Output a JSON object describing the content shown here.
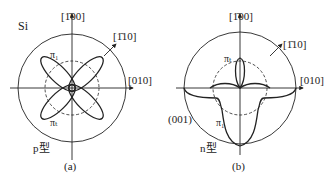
{
  "material": "Si",
  "panels": [
    {
      "id": "a",
      "caption": "(a)",
      "type_label": "p型",
      "axis_top": "[1̄00]",
      "axis_right": "[010]",
      "axis_diag": "[1̄10]",
      "pi_top": "π₁",
      "pi_bottom": "πₜ"
    },
    {
      "id": "b",
      "caption": "(b)",
      "type_label": "n型",
      "axis_top": "[1̄00]",
      "axis_right": "[010]",
      "axis_diag": "[1̄10]",
      "pi_top": "πₜ",
      "pi_bottom": "π₁",
      "plane": "(001)"
    }
  ],
  "colors": {
    "line": "#222222",
    "background": "#ffffff"
  }
}
